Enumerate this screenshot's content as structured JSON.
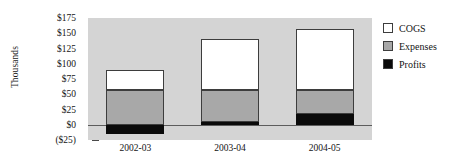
{
  "chart_data": {
    "type": "bar",
    "title": "",
    "subtitle": "",
    "xlabel": "",
    "ylabel": "Thousands",
    "stacked": true,
    "grid": false,
    "legend_position": "right",
    "categories": [
      "2002-03",
      "2003-04",
      "2004-05"
    ],
    "ylim": [
      -25,
      175
    ],
    "ytick_values": [
      175,
      150,
      125,
      100,
      75,
      50,
      25,
      0,
      -25
    ],
    "ytick_labels": [
      "$175",
      "$150",
      "$125",
      "$100",
      "$75",
      "$50",
      "$25",
      "$0",
      "($25)"
    ],
    "series": [
      {
        "name": "COGS",
        "color": "#ffffff",
        "values": [
          33,
          83,
          100
        ]
      },
      {
        "name": "Expenses",
        "color": "#a8a8a8",
        "values": [
          57,
          52,
          39
        ]
      },
      {
        "name": "Profits",
        "color": "#0a0a0a",
        "values": [
          -15,
          5,
          18
        ]
      }
    ],
    "bar_totals": [
      75,
      140,
      157
    ],
    "plot_background": "#d4d4d4",
    "axis_color": "#5c5c5c"
  },
  "legend": {
    "items": [
      {
        "label": "COGS",
        "color": "#ffffff"
      },
      {
        "label": "Expenses",
        "color": "#a8a8a8"
      },
      {
        "label": "Profits",
        "color": "#0a0a0a"
      }
    ]
  }
}
